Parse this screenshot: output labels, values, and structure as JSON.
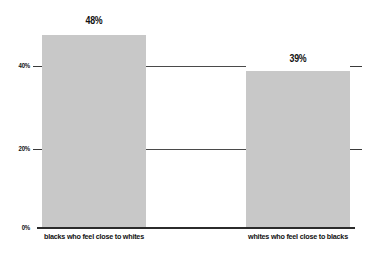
{
  "chart_data": {
    "type": "bar",
    "title": "",
    "subtitle": "",
    "xlabel": "",
    "ylabel": "",
    "categories": [
      "blacks who feel close to whites",
      "whites who feel close to blacks"
    ],
    "values": [
      48,
      39
    ],
    "value_labels": [
      "48%",
      "39%"
    ],
    "ylim": [
      0,
      48
    ],
    "y_ticks": [
      0,
      20,
      40
    ],
    "y_tick_labels": [
      "0%",
      "20%",
      "40%"
    ],
    "grid": true,
    "grid_axis": "y",
    "legend": false,
    "legend_position": "none",
    "bar_color": "#c8c8c8",
    "axis_color": "#2b2b2b",
    "grid_color": "#4a4a4a",
    "text_color": "#111111",
    "background": "#ffffff",
    "series": [
      {
        "name": "percent feeling close",
        "values": [
          48,
          39
        ]
      }
    ]
  },
  "axis": {
    "y_tick_40": "40%",
    "y_tick_20": "20%",
    "y_tick_0": "0%"
  },
  "bars": [
    {
      "category": "blacks who feel close to whites",
      "value_label": "48%"
    },
    {
      "category": "whites who feel close to blacks",
      "value_label": "39%"
    }
  ]
}
